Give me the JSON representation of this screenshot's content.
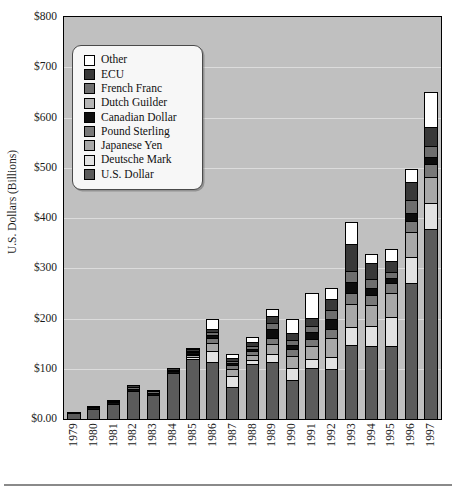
{
  "chart_data": {
    "type": "bar",
    "subtype": "stacked",
    "title": "",
    "xlabel": "",
    "ylabel": "U.S. Dollars (Billions)",
    "ylim": [
      0,
      800
    ],
    "ytick_labels": [
      "$0.00",
      "$100",
      "$200",
      "$300",
      "$400",
      "$500",
      "$600",
      "$700",
      "$800"
    ],
    "ytick_values": [
      0,
      100,
      200,
      300,
      400,
      500,
      600,
      700,
      800
    ],
    "grid": true,
    "legend_position": "upper-left-inside",
    "categories": [
      "1979",
      "1980",
      "1981",
      "1982",
      "1983",
      "1984",
      "1985",
      "1986",
      "1987",
      "1988",
      "1989",
      "1990",
      "1991",
      "1992",
      "1993",
      "1994",
      "1995",
      "1996",
      "1997"
    ],
    "series": [
      {
        "name": "U.S. Dollar",
        "color": "#5b5b5b",
        "values": [
          11,
          20,
          30,
          56,
          48,
          92,
          120,
          113,
          63,
          110,
          113,
          78,
          102,
          100,
          148,
          145,
          145,
          270,
          378
        ]
      },
      {
        "name": "Deutsche Mark",
        "color": "#e2e2e2",
        "values": [
          0,
          0,
          0,
          0,
          0,
          0,
          3,
          22,
          22,
          8,
          16,
          24,
          18,
          24,
          35,
          40,
          58,
          52,
          52
        ]
      },
      {
        "name": "Japanese Yen",
        "color": "#a8a8a8",
        "values": [
          0,
          0,
          0,
          0,
          0,
          0,
          4,
          17,
          14,
          10,
          21,
          24,
          25,
          38,
          45,
          42,
          48,
          50,
          52
        ]
      },
      {
        "name": "Pound Sterling",
        "color": "#787878",
        "values": [
          0,
          0,
          0,
          0,
          0,
          0,
          3,
          9,
          8,
          7,
          12,
          13,
          14,
          18,
          22,
          20,
          20,
          22,
          26
        ]
      },
      {
        "name": "Canadian Dollar",
        "color": "#0d0d0d",
        "values": [
          2,
          4,
          3,
          4,
          3,
          3,
          3,
          6,
          4,
          4,
          18,
          8,
          14,
          20,
          22,
          13,
          10,
          16,
          14
        ]
      },
      {
        "name": "French Franc",
        "color": "#6e6e6e",
        "values": [
          0,
          0,
          2,
          4,
          4,
          3,
          3,
          6,
          4,
          6,
          12,
          11,
          12,
          16,
          22,
          18,
          12,
          26,
          22
        ]
      },
      {
        "name": "ECU",
        "color": "#383838",
        "values": [
          0,
          2,
          2,
          3,
          3,
          3,
          3,
          7,
          6,
          8,
          14,
          14,
          16,
          22,
          55,
          32,
          22,
          36,
          38
        ]
      },
      {
        "name": "Other",
        "color": "#ffffff",
        "values": [
          0,
          0,
          0,
          0,
          0,
          0,
          3,
          20,
          8,
          10,
          13,
          28,
          50,
          23,
          44,
          18,
          23,
          26,
          68
        ]
      }
    ],
    "series_order_bottom_to_top": [
      "U.S. Dollar",
      "Deutsche Mark",
      "Japanese Yen",
      "Pound Sterling",
      "Canadian Dollar",
      "French Franc",
      "ECU",
      "Other"
    ],
    "totals": [
      13,
      26,
      37,
      67,
      58,
      101,
      142,
      200,
      129,
      163,
      219,
      200,
      251,
      261,
      393,
      328,
      338,
      498,
      650
    ],
    "plot_background_color": "#c0c0c0",
    "gridline_color": "#dcdcdc"
  },
  "legend": {
    "items": [
      {
        "label": "Other",
        "color": "#ffffff"
      },
      {
        "label": "ECU",
        "color": "#383838"
      },
      {
        "label": "French Franc",
        "color": "#6e6e6e"
      },
      {
        "label": "Dutch Guilder",
        "color": "#b4b4b4"
      },
      {
        "label": "Canadian Dollar",
        "color": "#0d0d0d"
      },
      {
        "label": "Pound Sterling",
        "color": "#787878"
      },
      {
        "label": "Japanese Yen",
        "color": "#a8a8a8"
      },
      {
        "label": "Deutsche Mark",
        "color": "#e2e2e2"
      },
      {
        "label": "U.S. Dollar",
        "color": "#5b5b5b"
      }
    ]
  }
}
